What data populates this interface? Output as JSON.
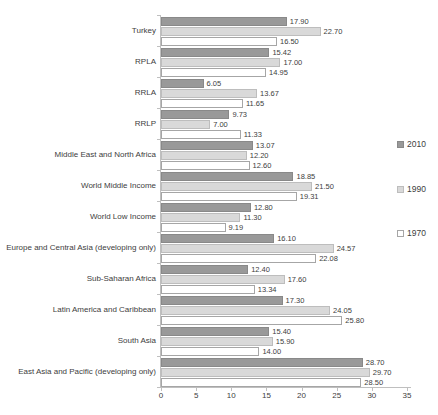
{
  "chart_data": {
    "type": "bar",
    "orientation": "horizontal",
    "title": "",
    "categories": [
      "Turkey",
      "RPLA",
      "RRLA",
      "RRLP",
      "Middle East and North Africa",
      "World Middle Income",
      "World Low Income",
      "Europe and Central Asia (developing only)",
      "Sub-Saharan Africa",
      "Latin America and Caribbean",
      "South Asia",
      "East Asia and Pacific (developing only)"
    ],
    "series": [
      {
        "name": "2010",
        "color": "#999999",
        "border_color": "#898989",
        "values": [
          17.9,
          15.42,
          6.05,
          9.73,
          13.07,
          18.85,
          12.8,
          16.1,
          12.4,
          17.3,
          15.4,
          28.7
        ]
      },
      {
        "name": "1990",
        "color": "#D9D9D9",
        "border_color": "#BDBDBD",
        "values": [
          22.7,
          17.0,
          13.67,
          7.0,
          12.2,
          21.5,
          11.3,
          24.57,
          17.6,
          24.05,
          15.9,
          29.7
        ]
      },
      {
        "name": "1970",
        "color": "#FFFFFF",
        "border_color": "#A6A6A6",
        "values": [
          16.5,
          14.95,
          11.65,
          11.33,
          12.6,
          19.31,
          9.19,
          22.08,
          13.34,
          25.8,
          14.0,
          28.5
        ]
      }
    ],
    "x_axis": {
      "min": 0,
      "max": 35,
      "ticks": [
        "0",
        "5",
        "10",
        "15",
        "20",
        "25",
        "30",
        "35"
      ]
    },
    "legend": {
      "position": "right",
      "entries": [
        "2010",
        "1990",
        "1970"
      ]
    },
    "value_labels_shown": true,
    "value_label_decimals": 2,
    "text_color": "#404040",
    "axis_color": "#BFBFBF",
    "grid": false
  }
}
